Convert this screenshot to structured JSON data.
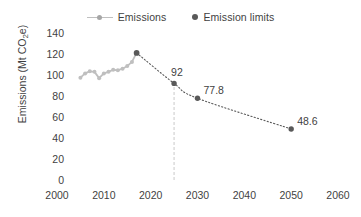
{
  "chart_data": {
    "type": "line",
    "title": "",
    "xlabel": "",
    "ylabel": "Emissions (Mt CO2e)",
    "ylabel_parts": {
      "prefix": "Emissions (Mt CO",
      "sub": "2",
      "suffix": "e)"
    },
    "xlim": [
      2000,
      2060
    ],
    "ylim": [
      0,
      140
    ],
    "xticks": [
      2000,
      2010,
      2020,
      2030,
      2040,
      2050,
      2060
    ],
    "yticks": [
      0,
      20,
      40,
      60,
      80,
      100,
      120,
      140
    ],
    "grid": false,
    "legend_position": "top-center",
    "series": [
      {
        "name": "Emissions",
        "style": "solid-line-with-markers",
        "color": "#bfbfbf",
        "x": [
          2005,
          2006,
          2007,
          2008,
          2009,
          2010,
          2011,
          2012,
          2013,
          2014,
          2015,
          2016,
          2017
        ],
        "values": [
          97.5,
          101.5,
          103.5,
          103.0,
          97.0,
          101.5,
          103.0,
          105.0,
          104.5,
          106.0,
          108.5,
          112.5,
          121.0
        ]
      },
      {
        "name": "Emission limits",
        "style": "dotted-line-with-markers",
        "color": "#595959",
        "x": [
          2017,
          2025,
          2030,
          2050
        ],
        "values": [
          121.0,
          92.0,
          77.8,
          48.6
        ],
        "labels": [
          "",
          "92",
          "77.8",
          "48.6"
        ]
      }
    ],
    "annotations": [
      {
        "type": "vline",
        "x": 2025,
        "from_y": 0,
        "to_y": 92,
        "color": "#d9d9d9",
        "style": "dashed"
      }
    ]
  },
  "legend": {
    "entries": [
      {
        "label": "Emissions",
        "marker": "line-marker",
        "color": "#bfbfbf"
      },
      {
        "label": "Emission limits",
        "marker": "dot",
        "color": "#595959"
      }
    ]
  }
}
